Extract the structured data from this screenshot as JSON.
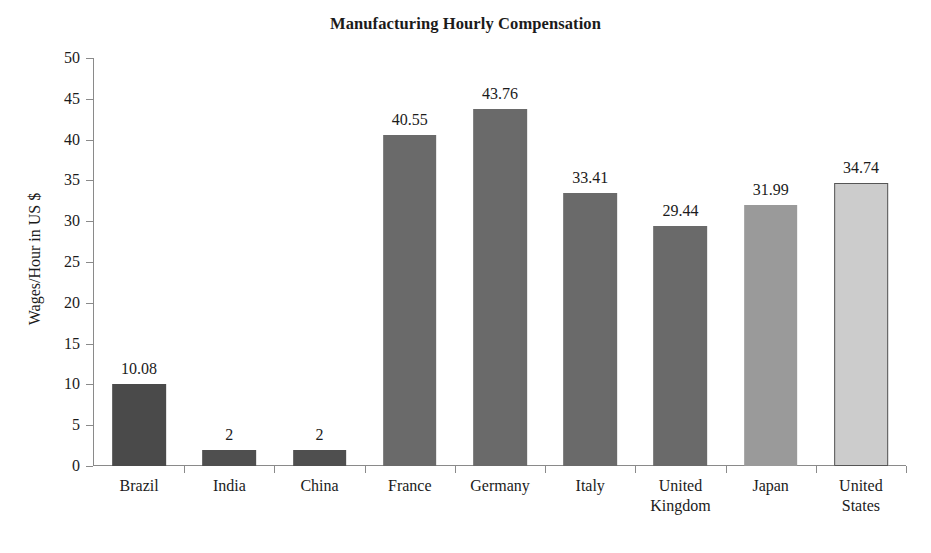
{
  "chart_data": {
    "type": "bar",
    "title": "Manufacturing Hourly Compensation",
    "xlabel": "",
    "ylabel": "Wages/Hour in US $",
    "ylim": [
      0,
      50
    ],
    "ytick_step": 5,
    "grid": false,
    "legend": "none",
    "categories": [
      "Brazil",
      "India",
      "China",
      "France",
      "Germany",
      "Italy",
      "United Kingdom",
      "Japan",
      "United States"
    ],
    "values": [
      10.08,
      2,
      2,
      40.55,
      43.76,
      33.41,
      29.44,
      31.99,
      34.74
    ],
    "value_labels": [
      "10.08",
      "2",
      "2",
      "40.55",
      "43.76",
      "33.41",
      "29.44",
      "31.99",
      "34.74"
    ],
    "bar_colors": [
      "#4a4a4a",
      "#4f4f4f",
      "#4f4f4f",
      "#6a6a6a",
      "#6a6a6a",
      "#6a6a6a",
      "#6a6a6a",
      "#9a9a9a",
      "#cccccc"
    ],
    "bar_border_colors": [
      "none",
      "none",
      "none",
      "none",
      "none",
      "none",
      "none",
      "none",
      "#555555"
    ],
    "ytick_labels": [
      "0",
      "5",
      "10",
      "15",
      "20",
      "25",
      "30",
      "35",
      "40",
      "45",
      "50"
    ],
    "ytick_values": [
      0,
      5,
      10,
      15,
      20,
      25,
      30,
      35,
      40,
      45,
      50
    ],
    "axis_color": "#8a8a8a",
    "text_color": "#1b1b1b",
    "background": "#ffffff"
  }
}
